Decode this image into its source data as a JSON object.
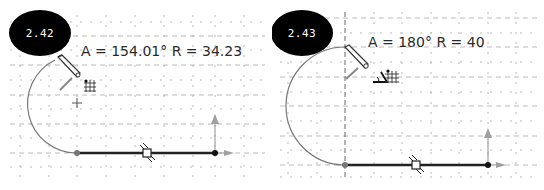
{
  "figures": [
    {
      "id": "left",
      "badge": "2.42",
      "readout": "A = 154.01° R = 34.23",
      "angle_deg": 154.01,
      "radius": 34.23,
      "cursor_icons": [
        "pencil-icon",
        "grid-snap-icon"
      ]
    },
    {
      "id": "right",
      "badge": "2.43",
      "readout": "A = 180° R = 40",
      "angle_deg": 180,
      "radius": 40,
      "cursor_icons": [
        "pencil-icon",
        "angle-snap-icon",
        "grid-snap-icon"
      ]
    }
  ],
  "colors": {
    "badge_bg": "#000000",
    "badge_text": "#ffffff",
    "grid": "#9a9a9a",
    "sketch_line": "#222222",
    "arc": "#777777",
    "axis_arrow": "#a0a0a0"
  }
}
